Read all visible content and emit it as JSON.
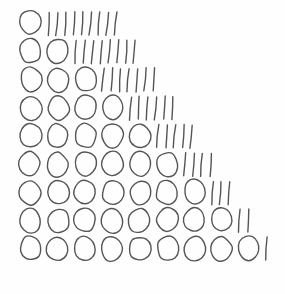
{
  "figure": {
    "background_color": "#fefefe",
    "stroke_color": "#555555",
    "stroke_width": 1.4,
    "row_total": 10,
    "row_count": 9,
    "origin": {
      "x": 20,
      "y": 11
    },
    "cell_width": 27.3,
    "row_height": 28.2,
    "circle": {
      "width": 21,
      "height": 24
    },
    "tally": {
      "width": 2,
      "height": 23,
      "pitch": 8.4,
      "lean": 1.6
    }
  },
  "chart_data": {
    "type": "table",
    "columns": [
      "row",
      "circles",
      "tallies",
      "total"
    ],
    "rows": [
      {
        "row": 1,
        "circles": 1,
        "tallies": 9,
        "total": 10
      },
      {
        "row": 2,
        "circles": 2,
        "tallies": 8,
        "total": 10
      },
      {
        "row": 3,
        "circles": 3,
        "tallies": 7,
        "total": 10
      },
      {
        "row": 4,
        "circles": 4,
        "tallies": 6,
        "total": 10
      },
      {
        "row": 5,
        "circles": 5,
        "tallies": 5,
        "total": 10
      },
      {
        "row": 6,
        "circles": 6,
        "tallies": 4,
        "total": 10
      },
      {
        "row": 7,
        "circles": 7,
        "tallies": 3,
        "total": 10
      },
      {
        "row": 8,
        "circles": 8,
        "tallies": 2,
        "total": 10
      },
      {
        "row": 9,
        "circles": 9,
        "tallies": 1,
        "total": 10
      }
    ],
    "categories": [
      "1",
      "2",
      "3",
      "4",
      "5",
      "6",
      "7",
      "8",
      "9"
    ],
    "series": [
      {
        "name": "circles",
        "values": [
          1,
          2,
          3,
          4,
          5,
          6,
          7,
          8,
          9
        ]
      },
      {
        "name": "tallies",
        "values": [
          9,
          8,
          7,
          6,
          5,
          4,
          3,
          2,
          1
        ]
      }
    ],
    "xlabel": "",
    "ylabel": "",
    "grid": false,
    "legend": "none"
  }
}
